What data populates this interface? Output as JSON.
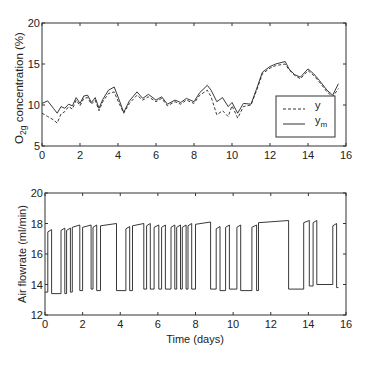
{
  "chart_data": [
    {
      "type": "line",
      "title": "",
      "xlabel": "",
      "ylabel": "O2g concentration (%)",
      "ylabel_parts": {
        "main": "O",
        "sub": "2g",
        "rest": " concentration (%)"
      },
      "xlim": [
        0,
        16
      ],
      "ylim": [
        5,
        20
      ],
      "xticks": [
        0,
        2,
        4,
        6,
        8,
        10,
        12,
        14,
        16
      ],
      "yticks": [
        5,
        10,
        15,
        20
      ],
      "grid": false,
      "legend_position": "lower right",
      "legend": [
        {
          "label": "y",
          "style": "dashed"
        },
        {
          "label": "y",
          "sub": "m",
          "style": "solid"
        }
      ],
      "x": [
        0,
        0.3,
        0.6,
        0.8,
        1.0,
        1.2,
        1.4,
        1.6,
        1.8,
        2.0,
        2.2,
        2.4,
        2.6,
        2.8,
        3.0,
        3.2,
        3.5,
        3.8,
        4.0,
        4.3,
        4.6,
        5.0,
        5.3,
        5.6,
        6.0,
        6.3,
        6.6,
        7.0,
        7.3,
        7.6,
        8.0,
        8.3,
        8.7,
        8.9,
        9.2,
        9.5,
        9.8,
        10.0,
        10.3,
        10.6,
        11.0,
        11.3,
        11.6,
        12.0,
        12.3,
        12.8,
        13.0,
        13.3,
        13.6,
        14.0,
        14.3,
        14.6,
        15.0,
        15.3,
        15.6
      ],
      "series": [
        {
          "name": "y",
          "values": [
            9.0,
            8.6,
            8.2,
            7.8,
            8.9,
            9.2,
            9.8,
            9.5,
            10.6,
            9.9,
            10.8,
            10.9,
            10.1,
            10.6,
            9.3,
            10.4,
            11.4,
            11.6,
            10.5,
            9.0,
            10.2,
            11.2,
            10.6,
            11.0,
            10.4,
            10.8,
            9.9,
            10.4,
            10.1,
            10.6,
            10.2,
            11.2,
            11.8,
            11.0,
            8.8,
            9.3,
            8.6,
            9.9,
            8.4,
            9.8,
            10.0,
            11.8,
            13.8,
            14.5,
            14.8,
            15.0,
            14.3,
            13.6,
            13.2,
            14.2,
            13.6,
            12.8,
            11.6,
            11.0,
            12.0
          ]
        },
        {
          "name": "y_m",
          "values": [
            10.2,
            10.5,
            9.6,
            9.0,
            9.8,
            9.6,
            10.1,
            9.9,
            10.9,
            10.2,
            11.1,
            11.2,
            10.3,
            10.9,
            9.6,
            10.7,
            11.8,
            12.2,
            11.0,
            9.1,
            10.5,
            11.6,
            10.8,
            11.3,
            10.6,
            11.0,
            10.1,
            10.6,
            10.3,
            10.8,
            10.4,
            11.5,
            12.4,
            11.8,
            10.4,
            10.9,
            9.8,
            10.3,
            9.0,
            10.2,
            10.1,
            12.0,
            14.0,
            14.7,
            15.0,
            15.3,
            14.4,
            13.7,
            13.4,
            14.4,
            13.8,
            13.0,
            11.8,
            11.2,
            12.6
          ]
        }
      ]
    },
    {
      "type": "line",
      "title": "",
      "xlabel": "Time (days)",
      "ylabel": "Air flowrate (ml/min)",
      "xlim": [
        0,
        16
      ],
      "ylim": [
        12,
        20
      ],
      "xticks": [
        0,
        2,
        4,
        6,
        8,
        10,
        12,
        14,
        16
      ],
      "yticks": [
        12,
        14,
        16,
        18,
        20
      ],
      "grid": false,
      "step": true,
      "low_level": 13.6,
      "high_level": 17.9,
      "pulses": [
        {
          "start": 0.15,
          "end": 0.35,
          "high": 17.6,
          "low": 13.4
        },
        {
          "start": 0.85,
          "end": 1.05,
          "high": 17.7,
          "low": 13.4
        },
        {
          "start": 1.15,
          "end": 1.35,
          "high": 17.7,
          "low": 13.5
        },
        {
          "start": 1.45,
          "end": 1.85,
          "high": 17.9,
          "low": 13.6
        },
        {
          "start": 2.0,
          "end": 2.45,
          "high": 17.9,
          "low": 13.7
        },
        {
          "start": 2.55,
          "end": 2.75,
          "high": 17.9,
          "low": 13.6
        },
        {
          "start": 2.95,
          "end": 3.8,
          "high": 18.0,
          "low": 13.6
        },
        {
          "start": 4.3,
          "end": 4.5,
          "high": 17.8,
          "low": 13.6
        },
        {
          "start": 4.65,
          "end": 5.25,
          "high": 18.0,
          "low": 13.7
        },
        {
          "start": 5.4,
          "end": 5.6,
          "high": 18.0,
          "low": 13.7
        },
        {
          "start": 5.8,
          "end": 6.05,
          "high": 17.9,
          "low": 13.7
        },
        {
          "start": 6.2,
          "end": 6.4,
          "high": 17.9,
          "low": 13.7
        },
        {
          "start": 6.7,
          "end": 6.9,
          "high": 17.9,
          "low": 13.7
        },
        {
          "start": 7.0,
          "end": 7.2,
          "high": 17.9,
          "low": 13.7
        },
        {
          "start": 7.3,
          "end": 7.5,
          "high": 17.9,
          "low": 13.7
        },
        {
          "start": 7.6,
          "end": 7.8,
          "high": 18.0,
          "low": 13.7
        },
        {
          "start": 8.0,
          "end": 8.8,
          "high": 18.1,
          "low": 13.7
        },
        {
          "start": 9.1,
          "end": 9.3,
          "high": 17.8,
          "low": 13.6
        },
        {
          "start": 9.6,
          "end": 9.8,
          "high": 17.9,
          "low": 13.7
        },
        {
          "start": 10.2,
          "end": 10.4,
          "high": 17.9,
          "low": 13.6
        },
        {
          "start": 11.0,
          "end": 11.25,
          "high": 17.9,
          "low": 13.6
        },
        {
          "start": 11.35,
          "end": 12.95,
          "high": 18.2,
          "low": 13.7
        },
        {
          "start": 13.75,
          "end": 14.05,
          "high": 18.2,
          "low": 13.9
        },
        {
          "start": 14.25,
          "end": 14.45,
          "high": 18.2,
          "low": 14.0
        },
        {
          "start": 15.3,
          "end": 15.5,
          "high": 18.0,
          "low": 13.8
        }
      ]
    }
  ],
  "plot_top": {
    "ylabel_main": "O",
    "ylabel_sub": "2g",
    "ylabel_rest": " concentration (%)",
    "legend_y": "y",
    "legend_ym": "y",
    "legend_ym_sub": "m"
  },
  "plot_bottom": {
    "ylabel": "Air flowrate (ml/min)",
    "xlabel": "Time (days)"
  }
}
